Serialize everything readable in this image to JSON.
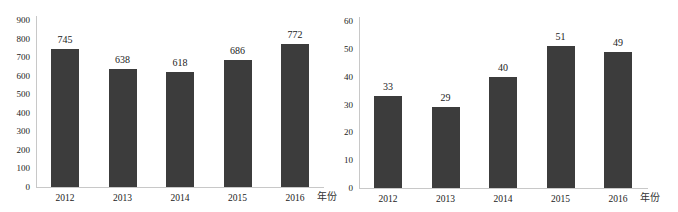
{
  "colors": {
    "bar": "#3c3c3c",
    "axis": "#c8c8c8",
    "text": "#222222"
  },
  "chart_data": [
    {
      "type": "bar",
      "title": "",
      "xlabel": "年份",
      "ylabel": "",
      "categories": [
        "2012",
        "2013",
        "2014",
        "2015",
        "2016"
      ],
      "values": [
        745,
        638,
        618,
        686,
        772
      ],
      "data_labels": [
        "745",
        "638",
        "618",
        "686",
        "772"
      ],
      "ylim": [
        0,
        900
      ],
      "yticks": [
        "900",
        "800",
        "700",
        "600",
        "500",
        "400",
        "300",
        "200",
        "100",
        "0"
      ],
      "grid": false,
      "legend": null
    },
    {
      "type": "bar",
      "title": "",
      "xlabel": "年份",
      "ylabel": "",
      "categories": [
        "2012",
        "2013",
        "2014",
        "2015",
        "2016"
      ],
      "values": [
        33,
        29,
        40,
        51,
        49
      ],
      "data_labels": [
        "33",
        "29",
        "40",
        "51",
        "49"
      ],
      "ylim": [
        0,
        60
      ],
      "yticks": [
        "60",
        "50",
        "40",
        "30",
        "20",
        "10",
        "0"
      ],
      "grid": false,
      "legend": null
    }
  ]
}
